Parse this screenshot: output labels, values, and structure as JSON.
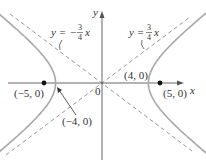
{
  "diagram": {
    "type": "hyperbola",
    "equation_implied": "x^2/16 - y^2/9 = 1",
    "axes": {
      "x_label": "x",
      "y_label": "y",
      "origin_label": "0"
    },
    "asymptotes": [
      {
        "label_prefix": "y = ",
        "sign": "",
        "num": "3",
        "den": "4",
        "var": "x",
        "slope": 0.75
      },
      {
        "label_prefix": "y = ",
        "sign": "−",
        "num": "3",
        "den": "4",
        "var": "x",
        "slope": -0.75
      }
    ],
    "points": {
      "vertex_right": {
        "label": "(4, 0)",
        "x": 4,
        "y": 0
      },
      "vertex_left": {
        "label": "(−4, 0)",
        "x": -4,
        "y": 0
      },
      "focus_right": {
        "label": "(5, 0)",
        "x": 5,
        "y": 0
      },
      "focus_left": {
        "label": "(−5, 0)",
        "x": -5,
        "y": 0
      }
    },
    "colors": {
      "curve": "#a8a8a8",
      "asymptote": "#8a8a8a",
      "axis": "#555555",
      "focus": "#111111",
      "text": "#333333"
    },
    "geometry": {
      "origin_px": [
        102,
        83
      ],
      "unit_px": 11.6
    }
  }
}
